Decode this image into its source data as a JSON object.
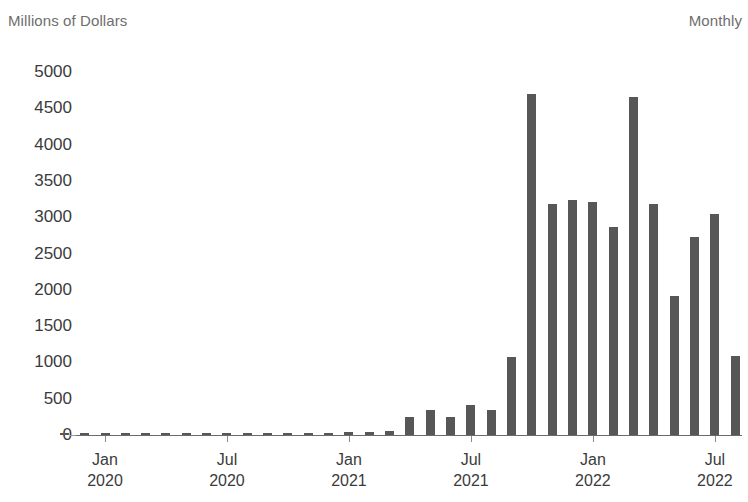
{
  "header": {
    "unit_label": "Millions of Dollars",
    "frequency_label": "Monthly"
  },
  "chart_data": {
    "type": "bar",
    "title": "",
    "subtitle": "",
    "xlabel": "",
    "ylabel": "Millions of Dollars",
    "ylim": [
      0,
      5000
    ],
    "grid": false,
    "legend": null,
    "bar_color": "#575757",
    "axis_color": "#6a6a6a",
    "text_color": "#3b3b3b",
    "header_text_color": "#6e6e6e",
    "yticks": [
      0,
      500,
      1000,
      1500,
      2000,
      2500,
      3000,
      3500,
      4000,
      4500,
      5000
    ],
    "ytick_labels": [
      "0",
      "500",
      "1000",
      "1500",
      "2000",
      "2500",
      "3000",
      "3500",
      "4000",
      "4500",
      "5000"
    ],
    "xtick_labels": [
      {
        "month": "Jan",
        "year": "2020",
        "index": 0
      },
      {
        "month": "Jul",
        "year": "2020",
        "index": 6
      },
      {
        "month": "Jan",
        "year": "2021",
        "index": 12
      },
      {
        "month": "Jul",
        "year": "2021",
        "index": 18
      },
      {
        "month": "Jan",
        "year": "2022",
        "index": 24
      },
      {
        "month": "Jul",
        "year": "2022",
        "index": 30
      }
    ],
    "categories": [
      "Nov 2019",
      "Dec 2019",
      "Jan 2020",
      "Feb 2020",
      "Mar 2020",
      "Apr 2020",
      "May 2020",
      "Jun 2020",
      "Jul 2020",
      "Aug 2020",
      "Sep 2020",
      "Oct 2020",
      "Nov 2020",
      "Dec 2020",
      "Jan 2021",
      "Feb 2021",
      "Mar 2021",
      "Apr 2021",
      "May 2021",
      "Jun 2021",
      "Jul 2021",
      "Aug 2021",
      "Sep 2021",
      "Oct 2021",
      "Nov 2021",
      "Dec 2021",
      "Jan 2022",
      "Feb 2022",
      "Mar 2022",
      "Apr 2022",
      "May 2022",
      "Jun 2022",
      "Jul 2022",
      "Aug 2022"
    ],
    "values": [
      10,
      12,
      18,
      20,
      22,
      25,
      22,
      24,
      28,
      30,
      26,
      28,
      30,
      32,
      38,
      45,
      60,
      250,
      350,
      250,
      420,
      340,
      1070,
      4700,
      3180,
      3240,
      3210,
      2860,
      4650,
      3180,
      1910,
      2730,
      3050,
      1090
    ],
    "note": "Bar heights read from the y-axis; early-period bars are near zero."
  }
}
